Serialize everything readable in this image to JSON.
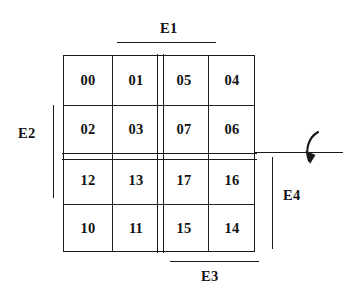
{
  "diagram": {
    "grid": {
      "rows": [
        {
          "cells": [
            "00",
            "01",
            "05",
            "04"
          ]
        },
        {
          "cells": [
            "02",
            "03",
            "07",
            "06"
          ]
        },
        {
          "cells": [
            "12",
            "13",
            "17",
            "16"
          ]
        },
        {
          "cells": [
            "10",
            "11",
            "15",
            "14"
          ]
        }
      ]
    },
    "edge_labels": {
      "top": "E1",
      "left": "E2",
      "bottom": "E3",
      "right": "E4"
    },
    "colors": {
      "line": "#1a1a1a",
      "text": "#111111",
      "background": "#ffffff"
    }
  }
}
